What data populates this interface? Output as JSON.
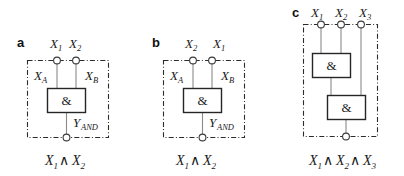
{
  "figure": {
    "background_color": "#ffffff",
    "line_color": "#2b2b2b",
    "wire_color": "#8a8a8a",
    "gate_symbol": "&",
    "and_operator": "∧"
  },
  "panels": [
    {
      "id": "panel-a",
      "letter": "a",
      "inputs": [
        {
          "name": "X",
          "sub": "1"
        },
        {
          "name": "X",
          "sub": "2"
        }
      ],
      "internal_labels": [
        {
          "name": "X",
          "sub": "A"
        },
        {
          "name": "X",
          "sub": "B"
        }
      ],
      "gates": [
        {
          "symbol": "&"
        }
      ],
      "output_label": {
        "name": "Y",
        "sub": "AND"
      },
      "formula": {
        "text": "X₁ ∧ X₂",
        "terms": [
          {
            "name": "X",
            "sub": "1"
          },
          {
            "name": "X",
            "sub": "2"
          }
        ],
        "operator": "∧"
      }
    },
    {
      "id": "panel-b",
      "letter": "b",
      "inputs": [
        {
          "name": "X",
          "sub": "2"
        },
        {
          "name": "X",
          "sub": "1"
        }
      ],
      "internal_labels": [
        {
          "name": "X",
          "sub": "A"
        },
        {
          "name": "X",
          "sub": "B"
        }
      ],
      "gates": [
        {
          "symbol": "&"
        }
      ],
      "output_label": {
        "name": "Y",
        "sub": "AND"
      },
      "formula": {
        "text": "X₁ ∧ X₂",
        "terms": [
          {
            "name": "X",
            "sub": "1"
          },
          {
            "name": "X",
            "sub": "2"
          }
        ],
        "operator": "∧"
      }
    },
    {
      "id": "panel-c",
      "letter": "c",
      "inputs": [
        {
          "name": "X",
          "sub": "1"
        },
        {
          "name": "X",
          "sub": "2"
        },
        {
          "name": "X",
          "sub": "3"
        }
      ],
      "internal_labels": [],
      "gates": [
        {
          "symbol": "&"
        },
        {
          "symbol": "&"
        }
      ],
      "output_label": null,
      "formula": {
        "text": "X₁ ∧ X₂ ∧ X₃",
        "terms": [
          {
            "name": "X",
            "sub": "1"
          },
          {
            "name": "X",
            "sub": "2"
          },
          {
            "name": "X",
            "sub": "3"
          }
        ],
        "operator": "∧"
      }
    }
  ],
  "text": {
    "panel_a_letter": "a",
    "panel_b_letter": "b",
    "panel_c_letter": "c",
    "gate_symbol": "&",
    "and_op": "∧",
    "X": "X",
    "Y": "Y",
    "sub_1": "1",
    "sub_2": "2",
    "sub_3": "3",
    "sub_A": "A",
    "sub_B": "B",
    "sub_AND": "AND"
  }
}
